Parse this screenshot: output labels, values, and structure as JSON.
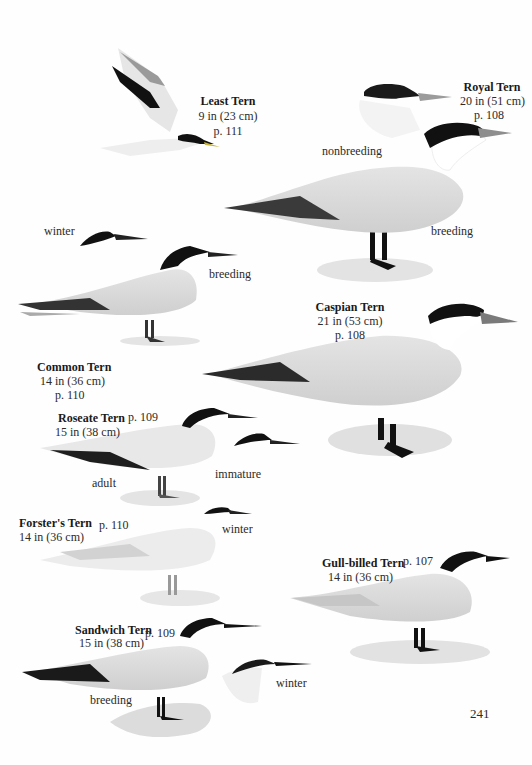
{
  "page_number": "241",
  "species": [
    {
      "id": "least-tern",
      "name": "Least Tern",
      "size": "9 in (23 cm)",
      "page": "p. 111",
      "plumage_labels": []
    },
    {
      "id": "royal-tern",
      "name": "Royal Tern",
      "size": "20 in (51 cm)",
      "page": "p. 108",
      "plumage_labels": [
        "nonbreeding",
        "breeding"
      ]
    },
    {
      "id": "common-tern",
      "name": "Common Tern",
      "size": "14 in (36 cm)",
      "page": "p. 110",
      "plumage_labels": [
        "winter",
        "breeding"
      ]
    },
    {
      "id": "caspian-tern",
      "name": "Caspian Tern",
      "size": "21 in (53 cm)",
      "page": "p. 108",
      "plumage_labels": []
    },
    {
      "id": "roseate-tern",
      "name": "Roseate Tern",
      "size": "15 in (38 cm)",
      "page": "p. 109",
      "plumage_labels": [
        "adult",
        "immature"
      ]
    },
    {
      "id": "forsters-tern",
      "name": "Forster's Tern",
      "size": "14 in (36 cm)",
      "page": "p. 110",
      "plumage_labels": [
        "winter"
      ]
    },
    {
      "id": "gull-billed-tern",
      "name": "Gull-billed Tern",
      "size": "14 in (36 cm)",
      "page": "p. 107",
      "plumage_labels": []
    },
    {
      "id": "sandwich-tern",
      "name": "Sandwich Tern",
      "size": "15 in (38 cm)",
      "page": "p. 109",
      "plumage_labels": [
        "breeding",
        "winter"
      ]
    }
  ],
  "colors": {
    "cap": "#111111",
    "mantle": "#d6d6d6",
    "mantle_dark": "#bdbdbd",
    "primaries": "#2e2e2e",
    "shadow": "#e2e2e2",
    "bill_gray": "#6a6a6a"
  }
}
